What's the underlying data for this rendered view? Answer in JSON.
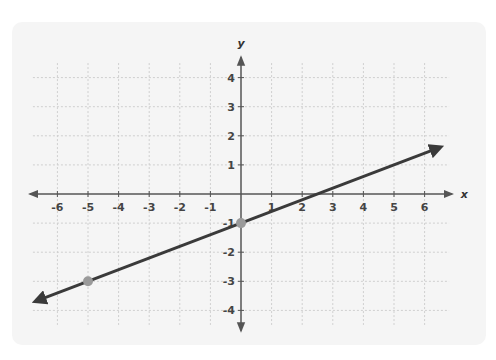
{
  "chart_data": {
    "type": "line",
    "title": "",
    "xlabel": "x",
    "ylabel": "y",
    "xlim": [
      -6.5,
      6.5
    ],
    "ylim": [
      -4.5,
      4.5
    ],
    "grid": true,
    "x_ticks": [
      -6,
      -5,
      -4,
      -3,
      -2,
      -1,
      1,
      2,
      3,
      4,
      5,
      6
    ],
    "y_ticks": [
      4,
      3,
      2,
      1,
      -1,
      -2,
      -3,
      -4
    ],
    "series": [
      {
        "name": "line",
        "equation": "y = 0.4x - 1",
        "x": [
          -6.7,
          6.5
        ],
        "y": [
          -3.68,
          1.6
        ],
        "arrows": "both",
        "color": "#3a3a3a"
      }
    ],
    "points": [
      {
        "x": 0,
        "y": -1,
        "color": "#9a9a9a"
      },
      {
        "x": -5,
        "y": -3,
        "color": "#9a9a9a"
      }
    ]
  },
  "colors": {
    "card_bg": "#f5f5f5",
    "grid": "#cfcfcf",
    "axis": "#555555",
    "line": "#3a3a3a",
    "point": "#9a9a9a"
  }
}
